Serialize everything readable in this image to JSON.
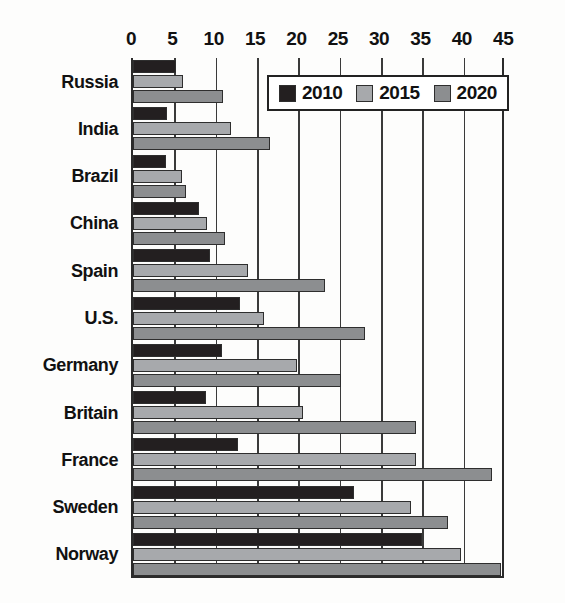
{
  "chart_data": {
    "type": "bar",
    "orientation": "horizontal",
    "title": "",
    "subtitle": "",
    "xlabel": "",
    "ylabel": "",
    "xlim": [
      0,
      45
    ],
    "ylim": null,
    "grid": true,
    "grid_axis": "x",
    "legend_position": "top-right",
    "x_ticks": [
      0,
      5,
      10,
      15,
      20,
      25,
      30,
      35,
      40,
      45
    ],
    "x_tick_labels": [
      "0",
      "5",
      "10",
      "15",
      "20",
      "25",
      "30",
      "35",
      "40",
      "45"
    ],
    "categories": [
      "Russia",
      "India",
      "Brazil",
      "China",
      "Spain",
      "U.S.",
      "Germany",
      "Britain",
      "France",
      "Sweden",
      "Norway"
    ],
    "series": [
      {
        "name": "2010",
        "color": "#231f20",
        "values": [
          5.2,
          4.1,
          4.0,
          8.0,
          9.3,
          12.9,
          10.8,
          8.8,
          12.7,
          26.7,
          35.0
        ]
      },
      {
        "name": "2015",
        "color": "#a7a9ac",
        "values": [
          6.1,
          11.9,
          5.9,
          9.0,
          13.9,
          15.8,
          19.8,
          20.6,
          34.2,
          33.6,
          39.7
        ]
      },
      {
        "name": "2020",
        "color": "#8c8e90",
        "values": [
          10.9,
          16.6,
          6.4,
          11.1,
          23.2,
          28.1,
          25.2,
          34.2,
          43.4,
          38.1,
          44.5
        ]
      }
    ],
    "colors": {
      "2010": "#231f20",
      "2015": "#a7a9ac",
      "2020": "#8c8e90",
      "axis": "#2b2b2b",
      "grid": "#3a3a3a",
      "background": "#fdfdfc",
      "text": "#111111"
    }
  },
  "legend": {
    "entries": [
      {
        "label": "2010",
        "color": "#231f20"
      },
      {
        "label": "2015",
        "color": "#a7a9ac"
      },
      {
        "label": "2020",
        "color": "#8c8e90"
      }
    ]
  }
}
